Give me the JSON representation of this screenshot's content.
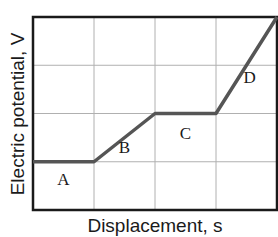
{
  "chart_data": {
    "type": "line",
    "title": "",
    "xlabel": "Displacement, s",
    "ylabel": "Electric potential, V",
    "grid": true,
    "legend": null,
    "xlim": [
      0,
      4
    ],
    "ylim": [
      0,
      4
    ],
    "x_ticks_labeled": false,
    "y_ticks_labeled": false,
    "series": [
      {
        "name": "V(s)",
        "x": [
          0,
          1,
          2,
          3,
          4
        ],
        "y": [
          1,
          1,
          2,
          2,
          4
        ]
      }
    ],
    "annotations": [
      {
        "text": "A",
        "x": 0.5,
        "y": 0.65
      },
      {
        "text": "B",
        "x": 1.5,
        "y": 1.3
      },
      {
        "text": "C",
        "x": 2.5,
        "y": 1.6
      },
      {
        "text": "D",
        "x": 3.55,
        "y": 2.75
      }
    ],
    "colors": {
      "line": "#555555",
      "grid": "#b0b0b0",
      "frame": "#1a1a1a"
    }
  }
}
